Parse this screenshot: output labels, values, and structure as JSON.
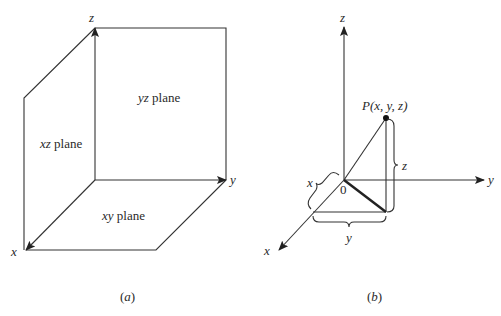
{
  "figure_a": {
    "caption": "(a)",
    "caption_letter": "a",
    "axes": {
      "x": "x",
      "y": "y",
      "z": "z"
    },
    "planes": {
      "yz": {
        "var": "yz",
        "word": " plane"
      },
      "xz": {
        "var": "xz",
        "word": " plane"
      },
      "xy": {
        "var": "xy",
        "word": " plane"
      }
    }
  },
  "figure_b": {
    "caption": "(b)",
    "caption_letter": "b",
    "axes": {
      "x": "x",
      "y": "y",
      "z": "z"
    },
    "origin_label": "0",
    "point_label": "P(x, y, z)",
    "brace_labels": {
      "x": "x",
      "y": "y",
      "z": "z"
    }
  },
  "colors": {
    "line": "#333333",
    "text": "#2a2a2a",
    "background": "#ffffff"
  }
}
